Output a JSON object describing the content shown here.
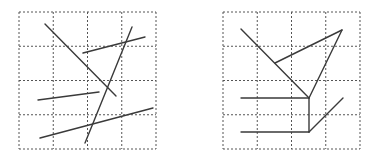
{
  "figure": {
    "width": 377,
    "height": 163,
    "background": "#ffffff",
    "grid_color": "#555555",
    "line_color": "#3a3a3a",
    "panels": [
      {
        "name": "left-panel",
        "description": "Five scattered straight line segments on a 4x4 dashed grid",
        "grid": {
          "x": 19,
          "y": 12,
          "size": 137,
          "cells": 4
        },
        "segments": [
          {
            "x1": 45,
            "y1": 24,
            "x2": 116,
            "y2": 96
          },
          {
            "x1": 83,
            "y1": 53,
            "x2": 145,
            "y2": 37
          },
          {
            "x1": 132,
            "y1": 27,
            "x2": 85,
            "y2": 143
          },
          {
            "x1": 38,
            "y1": 100,
            "x2": 99,
            "y2": 92
          },
          {
            "x1": 40,
            "y1": 138,
            "x2": 153,
            "y2": 108
          }
        ]
      },
      {
        "name": "right-panel",
        "description": "Connected line segments forming a figure on a 4x4 dashed grid",
        "grid": {
          "x": 223,
          "y": 12,
          "size": 137,
          "cells": 4
        },
        "segments": [
          {
            "x1": 241,
            "y1": 29,
            "x2": 309,
            "y2": 98
          },
          {
            "x1": 275,
            "y1": 63,
            "x2": 342,
            "y2": 30
          },
          {
            "x1": 342,
            "y1": 30,
            "x2": 309,
            "y2": 98
          },
          {
            "x1": 241,
            "y1": 98,
            "x2": 309,
            "y2": 98
          },
          {
            "x1": 309,
            "y1": 98,
            "x2": 309,
            "y2": 132
          },
          {
            "x1": 241,
            "y1": 132,
            "x2": 309,
            "y2": 132
          },
          {
            "x1": 309,
            "y1": 132,
            "x2": 343,
            "y2": 98
          }
        ]
      }
    ]
  }
}
